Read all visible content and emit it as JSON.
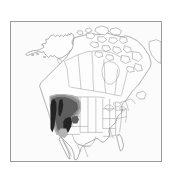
{
  "figure": {
    "kind": "species-range-map",
    "region": "North America",
    "top_caption": "",
    "bottom_caption": "",
    "frame": {
      "border_color": "#9a9a9a",
      "background_color": "#fbfbfb"
    },
    "land": {
      "fill_color": "#fdfdfd",
      "outline_color": "#6d6d6d",
      "subdivision_color": "#8c8c8c"
    },
    "range_shading": {
      "core_color": "#232323",
      "mid_color": "#5e5e5e",
      "light_color": "#8e8e8e",
      "pale_color": "#b4b4b4",
      "description": "Shaded distribution covering the Pacific Northwest, Idaho, western Montana, Wyoming, Utah and adjacent Nevada/Colorado"
    },
    "labels": {
      "alaska": "",
      "canada": "",
      "united_states": "",
      "mexico": "",
      "greenland": ""
    }
  }
}
